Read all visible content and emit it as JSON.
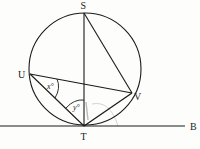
{
  "diagram": {
    "type": "circle-geometry",
    "colors": {
      "stroke": "#1a1a1a",
      "background": "#fdfdfb",
      "faint_mark": "#c8c8c8"
    },
    "circle": {
      "cx": 85,
      "cy": 69,
      "r": 56
    },
    "points": {
      "S": {
        "label": "S",
        "x": 84,
        "y": 13
      },
      "T": {
        "label": "T",
        "x": 84,
        "y": 126
      },
      "U": {
        "label": "U",
        "x": 30,
        "y": 74
      },
      "V": {
        "label": "V",
        "x": 132,
        "y": 93
      },
      "B": {
        "label": "B"
      }
    },
    "segments": [
      "ST",
      "SV",
      "UV",
      "UT",
      "TV"
    ],
    "tangent_line": {
      "from_x": 0,
      "to_x": 185,
      "y": 126,
      "end_label": "B"
    },
    "angles": {
      "x": {
        "label": "x°",
        "vertex": "U"
      },
      "y": {
        "label": "y°",
        "vertex": "T"
      }
    }
  }
}
